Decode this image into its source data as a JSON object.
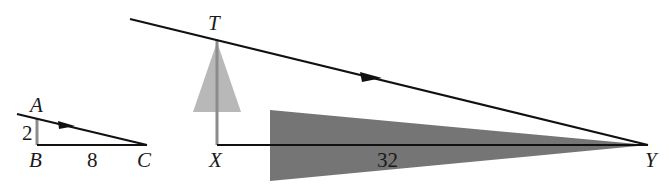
{
  "diagram": {
    "type": "similar-triangles-shadow-geometry",
    "colors": {
      "line": "#111111",
      "vertical_leg": "#8c8c8c",
      "light_cone": "#b8b8b8",
      "dark_wedge": "#6e6e6e",
      "background": "#ffffff"
    },
    "small_triangle": {
      "points": {
        "A": "A",
        "B": "B",
        "C": "C"
      },
      "side_AB": "2",
      "side_BC": "8"
    },
    "large_triangle": {
      "points": {
        "T": "T",
        "X": "X",
        "Y": "Y"
      },
      "side_XY": "32"
    }
  }
}
